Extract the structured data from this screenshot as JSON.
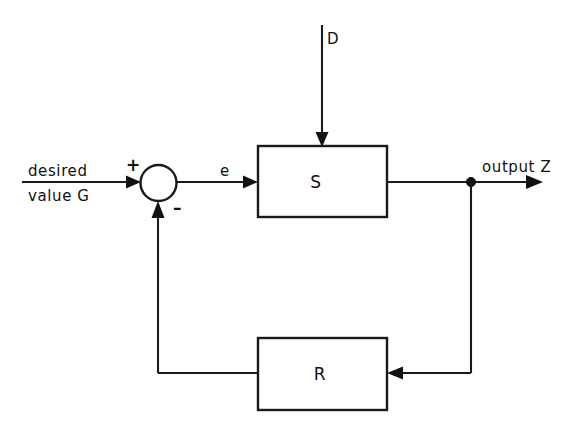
{
  "diagram": {
    "kind": "control-system-block-diagram",
    "background_color": "#ffffff",
    "line_color": "#1a1a1a",
    "blocks": [
      {
        "id": "S",
        "label": "S",
        "role": "controlled-system",
        "x": 258,
        "y": 146,
        "w": 129,
        "h": 71
      },
      {
        "id": "R",
        "label": "R",
        "role": "controller",
        "x": 258,
        "y": 338,
        "w": 129,
        "h": 72
      }
    ],
    "summing_junction": {
      "name": "summing-junction",
      "cx": 158.5,
      "cy": 183,
      "r": 18,
      "plus_sign": "+",
      "minus_sign": "–"
    },
    "signals": {
      "reference_line1": "desired",
      "reference_line2": "value G",
      "error": "e",
      "disturbance": "D",
      "output": "output Z"
    }
  }
}
